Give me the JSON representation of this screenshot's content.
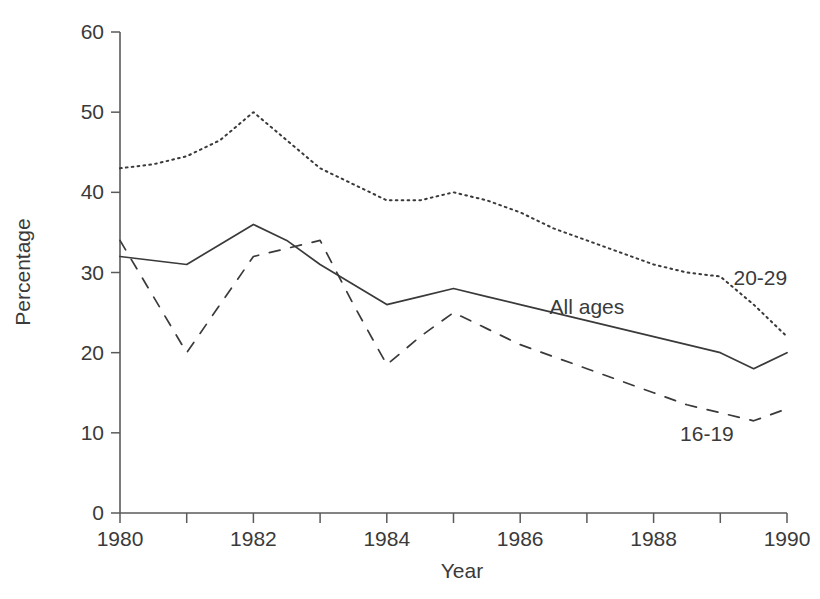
{
  "chart_data": {
    "type": "line",
    "title": "",
    "xlabel": "Year",
    "ylabel": "Percentage",
    "xlim": [
      1980,
      1990
    ],
    "ylim": [
      0,
      60
    ],
    "grid": false,
    "legend_position": "inline-annotations",
    "x_ticks_major": [
      1980,
      1982,
      1984,
      1986,
      1988,
      1990
    ],
    "x_ticks_minor": [
      1981,
      1983,
      1985,
      1987,
      1989
    ],
    "x_tick_labels": [
      "1980",
      "1982",
      "1984",
      "1986",
      "1988",
      "1990"
    ],
    "y_ticks": [
      0,
      10,
      20,
      30,
      40,
      50,
      60
    ],
    "y_tick_labels": [
      "0",
      "10",
      "20",
      "30",
      "40",
      "50",
      "60"
    ],
    "x": [
      1980,
      1980.5,
      1981,
      1981.5,
      1982,
      1982.5,
      1983,
      1983.5,
      1984,
      1984.5,
      1985,
      1985.5,
      1986,
      1986.5,
      1987,
      1987.5,
      1988,
      1988.5,
      1989,
      1989.5,
      1990
    ],
    "series": [
      {
        "name": "20-29",
        "style": "dotted",
        "color": "#3a3a3a",
        "annotation": "20-29",
        "values": [
          43,
          43.5,
          44.5,
          46.5,
          50,
          46.5,
          43,
          41,
          39,
          39,
          40,
          39,
          37.5,
          35.5,
          34,
          32.5,
          31,
          30,
          29.5,
          26,
          22
        ]
      },
      {
        "name": "All ages",
        "style": "solid",
        "color": "#3a3a3a",
        "annotation": "All ages",
        "values": [
          32,
          31.5,
          31,
          33.5,
          36,
          34,
          31,
          28.5,
          26,
          27,
          28,
          27,
          26,
          25,
          24,
          23,
          22,
          21,
          20,
          18,
          20
        ]
      },
      {
        "name": "16-19",
        "style": "dashed",
        "color": "#3a3a3a",
        "annotation": "16-19",
        "values": [
          34,
          27,
          20,
          26,
          32,
          33,
          34,
          26,
          18.5,
          22,
          25,
          23,
          21,
          19.5,
          18,
          16.5,
          15,
          13.5,
          12.5,
          11.5,
          13
        ]
      }
    ],
    "annotations": [
      {
        "text": "20-29",
        "x_value": 1989.6,
        "y_value": 28.5
      },
      {
        "text": "All ages",
        "x_value": 1987.0,
        "y_value": 24.8
      },
      {
        "text": "16-19",
        "x_value": 1988.8,
        "y_value": 9.0
      }
    ]
  }
}
